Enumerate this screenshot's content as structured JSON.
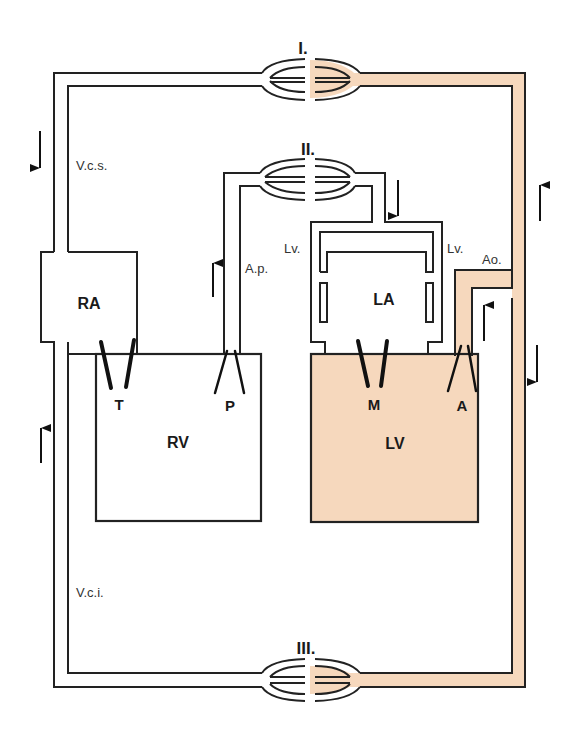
{
  "diagram": {
    "type": "circulation-schematic",
    "colors": {
      "line": "#222222",
      "oxygenated_fill": "#f6d8bd",
      "background": "#ffffff"
    },
    "capillary_beds": [
      {
        "id": "I",
        "label": "I."
      },
      {
        "id": "II",
        "label": "II."
      },
      {
        "id": "III",
        "label": "III."
      }
    ],
    "chambers": {
      "ra": "RA",
      "rv": "RV",
      "la": "LA",
      "lv": "LV"
    },
    "valves": {
      "tricuspid": "T",
      "pulmonary": "P",
      "mitral": "M",
      "aortic": "A"
    },
    "vessels": {
      "vcs": "V.c.s.",
      "vci": "V.c.i.",
      "ap": "A.p.",
      "lv_left": "Lv.",
      "lv_right": "Lv.",
      "ao": "Ao."
    },
    "flow_arrows": [
      {
        "location": "left-upper",
        "direction": "down"
      },
      {
        "location": "left-lower",
        "direction": "up"
      },
      {
        "location": "pulmonary-artery",
        "direction": "up"
      },
      {
        "location": "pulmonary-vein",
        "direction": "down"
      },
      {
        "location": "aorta-ascending",
        "direction": "up"
      },
      {
        "location": "right-upper",
        "direction": "up"
      },
      {
        "location": "right-lower",
        "direction": "down"
      }
    ]
  }
}
